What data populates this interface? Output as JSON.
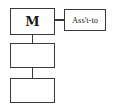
{
  "diagram": {
    "type": "org-chart",
    "nodes": [
      {
        "id": "m",
        "label": "M"
      },
      {
        "id": "asst",
        "label": "Ass't-to"
      },
      {
        "id": "sub1",
        "label": ""
      },
      {
        "id": "sub2",
        "label": ""
      }
    ],
    "edges": [
      {
        "from": "m",
        "to": "asst"
      },
      {
        "from": "m",
        "to": "sub1"
      },
      {
        "from": "sub1",
        "to": "sub2"
      }
    ],
    "colors": {
      "line": "#3a3a3a",
      "background": "#ffffff",
      "text": "#1a1a1a"
    }
  }
}
